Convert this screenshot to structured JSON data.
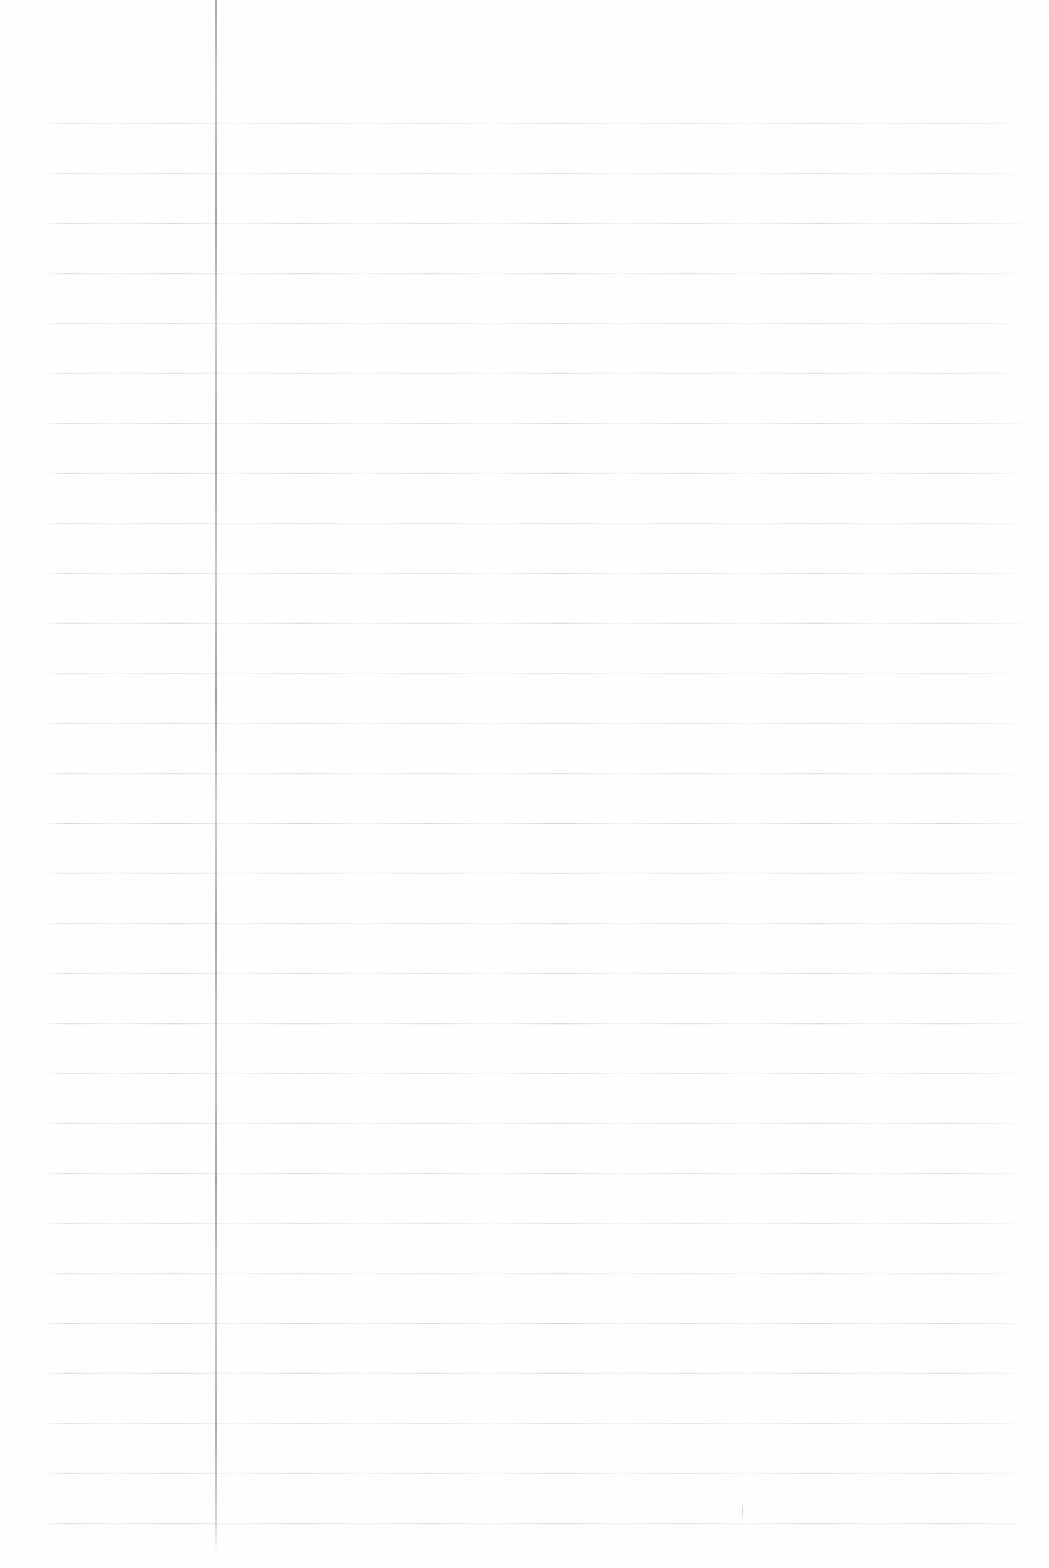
{
  "page": {
    "kind": "scanned-lined-notebook-page",
    "width": 1049,
    "height": 1568,
    "background_color": "#fefefe",
    "content_text": "",
    "handwriting_text": "",
    "typed_text": ""
  },
  "ruling": {
    "horizontal_rules": {
      "count": 29,
      "first_y": 123,
      "spacing": 50,
      "last_y": 1523,
      "x_start": 46,
      "x_end": 1035,
      "thickness": 1,
      "color": "#c8c8cd"
    },
    "margin_rule": {
      "label": "vertical-margin-line",
      "x": 215,
      "y_start": 0,
      "y_end": 1553,
      "thickness": 2,
      "color": "#8d8d92"
    }
  },
  "marks": [
    {
      "label": "stray-pen-mark",
      "x": 742,
      "y": 1503,
      "width": 1,
      "height": 16,
      "color": "#9a9a9f"
    }
  ]
}
